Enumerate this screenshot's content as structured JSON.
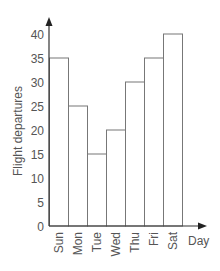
{
  "chart_data": {
    "type": "bar",
    "title": "",
    "xlabel": "Day",
    "ylabel": "Flight departures",
    "categories": [
      "Sun",
      "Mon",
      "Tue",
      "Wed",
      "Thu",
      "Fri",
      "Sat"
    ],
    "values": [
      35,
      25,
      15,
      20,
      30,
      35,
      40
    ],
    "ylim": [
      0,
      40
    ],
    "yticks": [
      0,
      5,
      10,
      15,
      20,
      25,
      30,
      35,
      40
    ],
    "grid": false,
    "legend": null,
    "colors": {
      "bar_fill": "#ffffff",
      "bar_stroke": "#777777",
      "axis": "#333333",
      "text": "#555555"
    }
  }
}
